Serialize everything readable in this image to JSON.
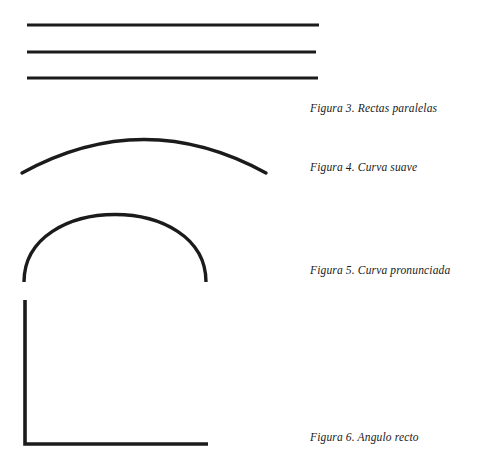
{
  "page": {
    "background_color": "#ffffff",
    "ink_color": "#1b1b1b",
    "width": 484,
    "height": 471,
    "language": "es"
  },
  "figures": [
    {
      "id": "figura-3",
      "number": "3",
      "caption": "Figura 3. Rectas paralelas",
      "shape_name": "parallel-lines",
      "description": "Tres rectas horizontales paralelas",
      "element_count": 3,
      "geometry": {
        "type": "lines",
        "stroke_width": 3,
        "lines": [
          {
            "x1": 27,
            "y1": 25,
            "x2": 319,
            "y2": 25
          },
          {
            "x1": 27,
            "y1": 52,
            "x2": 316,
            "y2": 52
          },
          {
            "x1": 27,
            "y1": 78,
            "x2": 318,
            "y2": 78
          }
        ]
      }
    },
    {
      "id": "figura-4",
      "number": "4",
      "caption": "Figura 4. Curva suave",
      "shape_name": "gentle-arc",
      "description": "Arco de curvatura suave y amplia",
      "element_count": 1,
      "geometry": {
        "type": "arc",
        "stroke_width": 3.4,
        "path": "M 22 61 Q 144 -6 266 61",
        "start": [
          22,
          173
        ],
        "end": [
          266,
          173
        ],
        "apex": [
          144,
          122
        ]
      }
    },
    {
      "id": "figura-5",
      "number": "5",
      "caption": "Figura 5. Curva pronunciada",
      "shape_name": "steep-arch",
      "description": "Arco semicircular de curvatura pronunciada",
      "element_count": 1,
      "geometry": {
        "type": "arc",
        "stroke_width": 3.4,
        "path": "M 24 86 C 24 -4 206 -4 206 86",
        "start": [
          24,
          282
        ],
        "end": [
          206,
          282
        ],
        "apex": [
          115,
          205
        ]
      }
    },
    {
      "id": "figura-6",
      "number": "6",
      "caption": "Figura 6. Angulo recto",
      "shape_name": "right-angle",
      "description": "Angulo recto formado por un segmento vertical y uno horizontal",
      "element_count": 2,
      "geometry": {
        "type": "polyline",
        "stroke_width": 3.6,
        "points": "25,6 25,150 208,150",
        "vertex": [
          25,
          444
        ],
        "vertical_top": [
          25,
          300
        ],
        "horizontal_end": [
          208,
          444
        ],
        "angle_degrees": 90
      }
    }
  ]
}
